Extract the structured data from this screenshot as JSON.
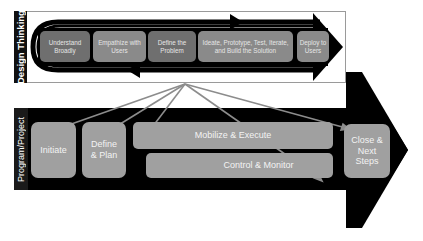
{
  "design_thinking": {
    "label": "Design Thinking",
    "steps": [
      {
        "label": "Understand Broadly"
      },
      {
        "label": "Empathize with Users"
      },
      {
        "label": "Define the Problem"
      },
      {
        "label": "Ideate, Prototype, Test, Iterate, and Build the Solution"
      },
      {
        "label": "Deploy to Users"
      }
    ]
  },
  "program_project": {
    "label": "Program/Project",
    "phases": [
      {
        "label": "Initiate"
      },
      {
        "label": "Define & Plan"
      },
      {
        "label": "Mobilize & Execute"
      },
      {
        "label": "Control & Monitor"
      },
      {
        "label": "Close & Next Steps"
      }
    ]
  },
  "colors": {
    "arrow": "#000000",
    "dt_box": "#6f6f6f",
    "pp_box": "#a0a0a0",
    "connector": "#8c8c8c",
    "panel_border": "#9a9a9a"
  }
}
